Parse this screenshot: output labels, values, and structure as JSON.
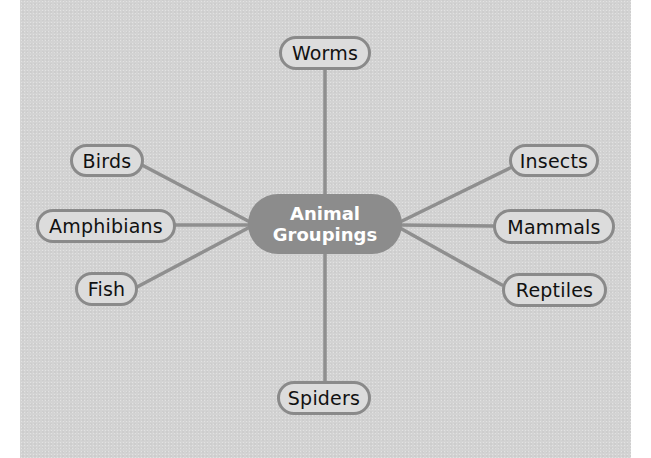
{
  "diagram": {
    "type": "concept-map",
    "center": {
      "line1": "Animal",
      "line2": "Groupings"
    },
    "nodes": [
      {
        "id": "worms",
        "label": "Worms",
        "position": "top"
      },
      {
        "id": "birds",
        "label": "Birds",
        "position": "upper-left"
      },
      {
        "id": "amphibians",
        "label": "Amphibians",
        "position": "left"
      },
      {
        "id": "fish",
        "label": "Fish",
        "position": "lower-left"
      },
      {
        "id": "insects",
        "label": "Insects",
        "position": "upper-right"
      },
      {
        "id": "mammals",
        "label": "Mammals",
        "position": "right"
      },
      {
        "id": "reptiles",
        "label": "Reptiles",
        "position": "lower-right"
      },
      {
        "id": "spiders",
        "label": "Spiders",
        "position": "bottom"
      }
    ],
    "colors": {
      "background": "#d3d3d3",
      "center_fill": "#8c8c8c",
      "center_text": "#ffffff",
      "node_border": "#8a8a8a",
      "connector": "#8f8f8f"
    }
  }
}
